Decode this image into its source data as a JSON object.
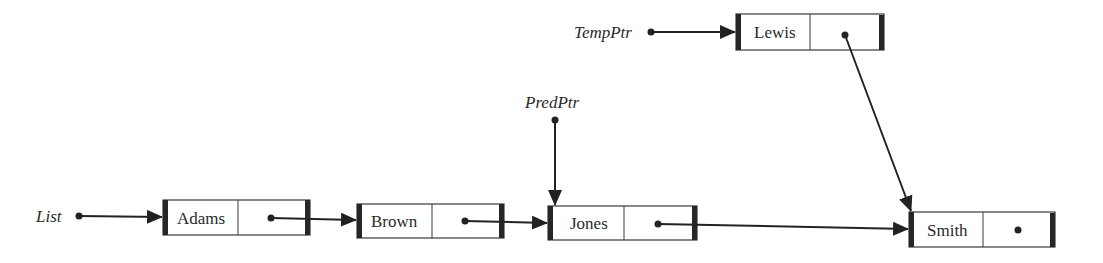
{
  "diagram": {
    "type": "linked-list-insertion",
    "pointers": {
      "list": {
        "label": "List"
      },
      "pred": {
        "label": "PredPtr"
      },
      "temp": {
        "label": "TempPtr"
      }
    },
    "nodes": [
      {
        "id": "adams",
        "value": "Adams"
      },
      {
        "id": "brown",
        "value": "Brown"
      },
      {
        "id": "jones",
        "value": "Jones"
      },
      {
        "id": "smith",
        "value": "Smith"
      },
      {
        "id": "lewis",
        "value": "Lewis"
      }
    ],
    "edges": [
      {
        "from": "List",
        "to": "Adams"
      },
      {
        "from": "Adams",
        "to": "Brown"
      },
      {
        "from": "Brown",
        "to": "Jones"
      },
      {
        "from": "Jones",
        "to": "Smith"
      },
      {
        "from": "PredPtr",
        "to": "Jones"
      },
      {
        "from": "TempPtr",
        "to": "Lewis"
      },
      {
        "from": "Lewis",
        "to": "Smith"
      },
      {
        "from": "Smith",
        "to": "null"
      }
    ]
  }
}
